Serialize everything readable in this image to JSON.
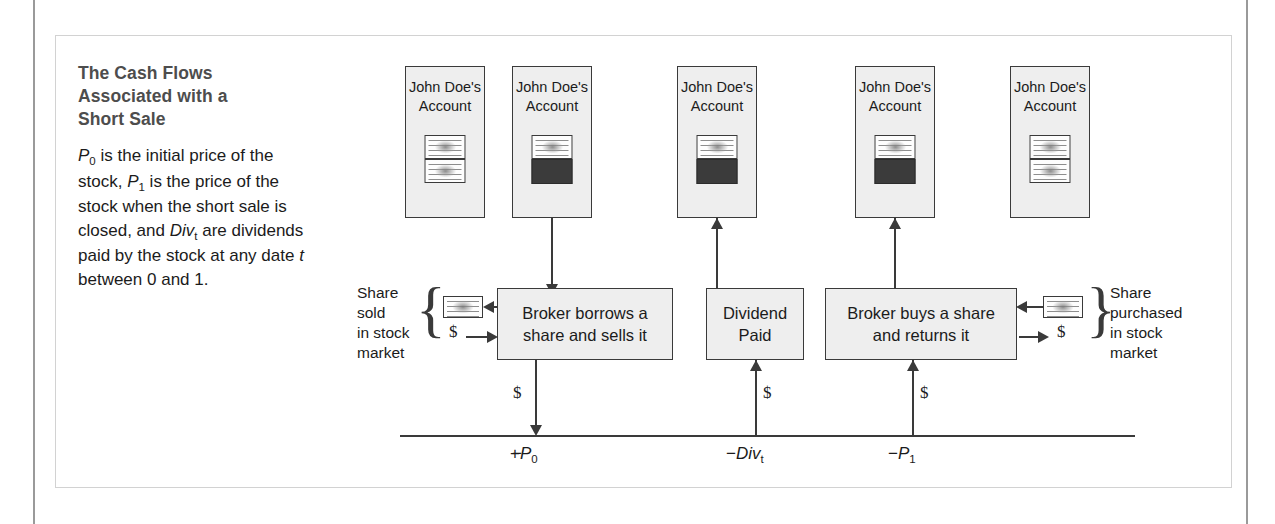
{
  "caption": {
    "title": "The Cash Flows\nAssociated with a\nShort Sale",
    "body_line1_pre": "",
    "body": "P0 is the initial price of the stock, P1 is the price of the stock when the short sale is closed, and Divt are dividends paid by the stock at any date t between 0 and 1."
  },
  "accounts": [
    {
      "label": "John Doe's\nAccount",
      "content": "two-certificates"
    },
    {
      "label": "John Doe's\nAccount",
      "content": "certificate-over-black"
    },
    {
      "label": "John Doe's\nAccount",
      "content": "certificate-over-black"
    },
    {
      "label": "John Doe's\nAccount",
      "content": "certificate-over-black"
    },
    {
      "label": "John Doe's\nAccount",
      "content": "two-certificates"
    }
  ],
  "events": [
    {
      "label": "Broker borrows a\nshare and sells it"
    },
    {
      "label": "Dividend\nPaid"
    },
    {
      "label": "Broker buys a share\nand returns it"
    }
  ],
  "market_labels": {
    "left": "Share\nsold\nin stock\nmarket",
    "right": "Share\npurchased\nin stock\nmarket"
  },
  "money_symbols": {
    "left_market": "$",
    "right_market": "$",
    "cash_flow_0": "$",
    "cash_flow_div": "$",
    "cash_flow_1": "$"
  },
  "timeline": {
    "values": [
      {
        "sign": "+",
        "symbol": "P",
        "subscript": "0",
        "text": "+P0"
      },
      {
        "sign": "−",
        "symbol": "Div",
        "subscript": "t",
        "text": "−Divt"
      },
      {
        "sign": "−",
        "symbol": "P",
        "subscript": "1",
        "text": "−P1"
      }
    ]
  },
  "colors": {
    "box_fill": "#eeeeee",
    "box_border": "#3a3a3a",
    "black_block": "#3b3b3b",
    "frame_border": "#d2d2d2",
    "title_text": "#4d4d4d",
    "body_text": "#1b1b1b"
  }
}
